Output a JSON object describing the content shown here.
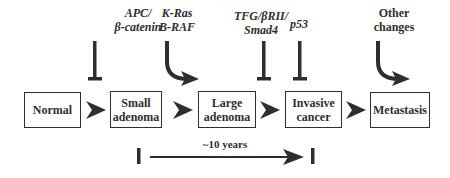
{
  "diagram": {
    "type": "flow",
    "title": "",
    "stages": [
      {
        "id": "normal",
        "label": "Normal"
      },
      {
        "id": "small_adenoma",
        "label": "Small adenoma",
        "line1": "Small",
        "line2": "adenoma"
      },
      {
        "id": "large_adenoma",
        "label": "Large adenoma",
        "line1": "Large",
        "line2": "adenoma"
      },
      {
        "id": "invasive_cancer",
        "label": "Invasive cancer",
        "line1": "Invasive",
        "line2": "cancer"
      },
      {
        "id": "metastasis",
        "label": "Metastasis"
      }
    ],
    "edges": [
      {
        "from": "normal",
        "to": "small_adenoma"
      },
      {
        "from": "small_adenoma",
        "to": "large_adenoma"
      },
      {
        "from": "large_adenoma",
        "to": "invasive_cancer"
      },
      {
        "from": "invasive_cancer",
        "to": "metastasis"
      }
    ],
    "regulators": [
      {
        "label_line1": "APC/",
        "label_line2": "β-catenin",
        "kind": "inhibition",
        "target_edge": "normal->small_adenoma",
        "italic": true
      },
      {
        "label_line1": "K-Ras",
        "label_line2": "B-RAF",
        "kind": "activation",
        "target_edge": "small_adenoma->large_adenoma",
        "italic": true
      },
      {
        "label_line1": "TFG/βRII/",
        "label_line2": "Smad4",
        "kind": "inhibition",
        "target_edge": "large_adenoma->invasive_cancer",
        "italic": true
      },
      {
        "label_line1": "p53",
        "kind": "inhibition",
        "target_edge": "large_adenoma->invasive_cancer",
        "italic": true
      },
      {
        "label_line1": "Other",
        "label_line2": "changes",
        "kind": "activation",
        "target_edge": "invasive_cancer->metastasis",
        "italic": false
      }
    ],
    "timeline": {
      "label": "~10 years",
      "start_stage": "small_adenoma",
      "end_stage": "invasive_cancer"
    },
    "colors": {
      "ink": "#2e2e2e",
      "background": "#ffffff"
    }
  }
}
